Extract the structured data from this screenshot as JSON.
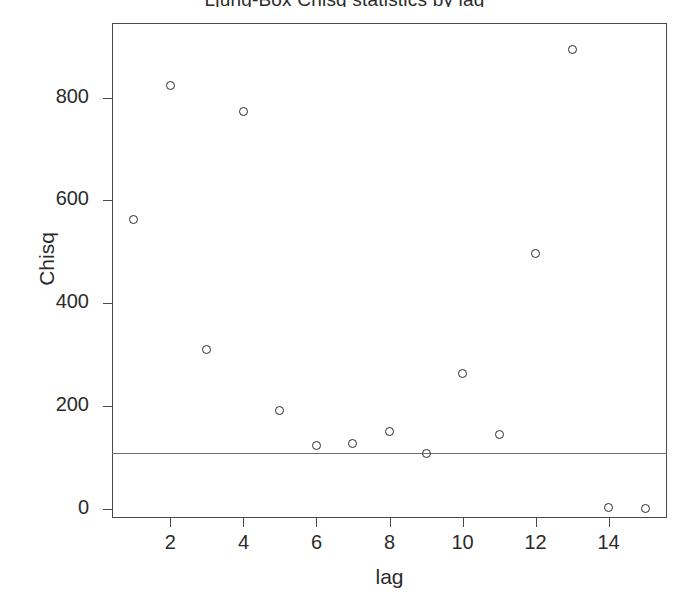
{
  "chart_data": {
    "type": "scatter",
    "title": "Ljung-Box Chisq statistics by lag",
    "xlabel": "lag",
    "ylabel": "Chisq",
    "x": [
      1,
      2,
      3,
      4,
      5,
      6,
      7,
      8,
      9,
      10,
      11,
      12,
      13,
      14,
      15
    ],
    "values": [
      562,
      824,
      309,
      773,
      191,
      124,
      126,
      151,
      108,
      263,
      145,
      497,
      894,
      2,
      0
    ],
    "series": [
      {
        "name": "Chisq",
        "values": [
          562,
          824,
          309,
          773,
          191,
          124,
          126,
          151,
          108,
          263,
          145,
          497,
          894,
          2,
          0
        ]
      }
    ],
    "xlim": [
      0.4,
      15.6
    ],
    "ylim": [
      -18,
      945
    ],
    "xticks": [
      2,
      4,
      6,
      8,
      10,
      12,
      14
    ],
    "xtick_labels": [
      "2",
      "4",
      "6",
      "8",
      "10",
      "12",
      "14"
    ],
    "yticks": [
      0,
      200,
      400,
      600,
      800
    ],
    "ytick_labels": [
      "0",
      "200",
      "400",
      "600",
      "800"
    ],
    "grid": false,
    "legend": null,
    "annotations": [
      {
        "type": "hline",
        "name": "significance-threshold",
        "y": 108,
        "label": ""
      }
    ],
    "marker": "open-circle",
    "marker_color": "#2a2a2a",
    "frame_color": "#4a4a4a",
    "background": "#ffffff"
  }
}
